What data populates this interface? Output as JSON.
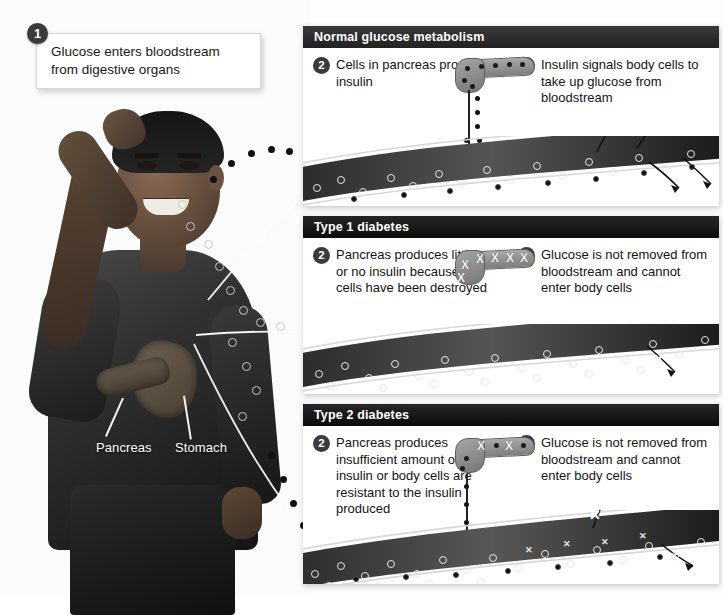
{
  "figure": {
    "photo_alt": "Young man with hand on head, digestive organs overlaid"
  },
  "callout": {
    "number": "1",
    "text": "Glucose enters bloodstream from digestive organs"
  },
  "organ_labels": [
    {
      "name": "pancreas-label",
      "text": "Pancreas"
    },
    {
      "name": "stomach-label",
      "text": "Stomach"
    }
  ],
  "panels": [
    {
      "id": "normal",
      "header": "Normal glucose metabolism",
      "step2": {
        "number": "2",
        "text": "Cells in pancreas produce insulin"
      },
      "step3": {
        "number": "3",
        "text": "Insulin signals body cells to take up glucose from bloodstream"
      },
      "pancreas_state": "producing-insulin",
      "vessel_note": "glucose and insulin both present; arrows exit vessel into body cells"
    },
    {
      "id": "type1",
      "header": "Type 1 diabetes",
      "step2": {
        "number": "2",
        "text": "Pancreas produces little or no insulin because cells have been destroyed"
      },
      "step3": {
        "number": "3",
        "text": "Glucose is not removed from bloodstream and cannot enter body cells"
      },
      "pancreas_state": "cells-destroyed-x",
      "vessel_note": "glucose only, no insulin; arrows crossed out with X"
    },
    {
      "id": "type2",
      "header": "Type 2 diabetes",
      "step2": {
        "number": "2",
        "text": "Pancreas produces insufficient amount of insulin or body cells are resistant to the insulin produced"
      },
      "step3": {
        "number": "3",
        "text": "Glucose is not removed from bloodstream and cannot enter body cells"
      },
      "pancreas_state": "partial-insulin-x",
      "vessel_note": "glucose with some insulin; arrows crossed out with X"
    }
  ],
  "legend_semantics": {
    "glucose_marker": "open light circle",
    "insulin_marker": "solid dark dot",
    "blocked_marker": "X"
  },
  "colors": {
    "panel_header_bg": "#222222",
    "panel_header_text": "#ffffff",
    "badge_bg": "#3b3b3b",
    "card_bg": "#ffffff",
    "vessel_dark": "#1d1d1d",
    "vessel_light": "#9b9b9b",
    "glucose_stroke": "#e8e8e8",
    "insulin_fill": "#101010"
  }
}
